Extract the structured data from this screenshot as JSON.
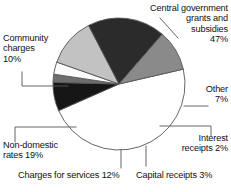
{
  "chart_data": {
    "type": "pie",
    "title": "",
    "subtitle": "",
    "xlabel": "",
    "ylabel": "",
    "legend_position": "callout-labels",
    "grid": false,
    "units": "percent",
    "total": 100,
    "start_angle_deg": -13,
    "direction": "clockwise",
    "categories": [
      "Central government grants and subsidies",
      "Other",
      "Interest receipts",
      "Capital receipts",
      "Charges for services",
      "Non-domestic rates",
      "Community charges"
    ],
    "values": [
      47,
      7,
      2,
      3,
      12,
      19,
      10
    ],
    "slice_colors": [
      "#ffffff",
      "#161616",
      "#6e6e6e",
      "#fbfbfb",
      "#c2c2c2",
      "#2b2b2b",
      "#8a8a8a"
    ],
    "slice_labels": [
      "Central government grants and subsidies 47%",
      "Other 7%",
      "Interest receipts 2%",
      "Capital receipts 3%",
      "Charges for services 12%",
      "Non-domestic rates 19%",
      "Community charges 10%"
    ]
  },
  "labels": {
    "central": "Central government\ngrants and\nsubsidies\n47%",
    "other": "Other\n7%",
    "interest": "Interest\nreceipts 2%",
    "capital": "Capital receipts 3%",
    "services": "Charges for services 12%",
    "nondomestic": "Non-domestic\nrates 19%",
    "community": "Community\ncharges\n10%"
  },
  "style": {
    "outline_color": "#555555",
    "leader_color": "#555555",
    "text_color": "#111111",
    "background": "#ffffff"
  }
}
